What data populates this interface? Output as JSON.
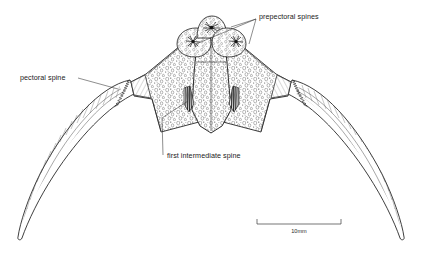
{
  "figure": {
    "type": "scientific-line-illustration",
    "background_color": "#ffffff",
    "ink_color": "#1c1c1c"
  },
  "labels": [
    {
      "id": "prepectoral-spines",
      "text": "prepectoral spines",
      "x": 259,
      "y": 17,
      "anchor": "start",
      "leader_origin": [
        256,
        19
      ],
      "leader_targets": [
        [
          196,
          44
        ],
        [
          231,
          27
        ],
        [
          249,
          44
        ]
      ]
    },
    {
      "id": "pectoral-spine",
      "text": "pectoral spine",
      "x": 20,
      "y": 80,
      "anchor": "start",
      "leader_origin": [
        78,
        78
      ],
      "leader_targets": [
        [
          118,
          89
        ]
      ]
    },
    {
      "id": "first-intermediate-spine",
      "text": "first intermediate spine",
      "x": 166,
      "y": 158,
      "anchor": "start",
      "leader_origin": [
        162,
        155
      ],
      "leader_targets": [
        [
          162,
          118
        ],
        [
          188,
          101
        ]
      ]
    }
  ],
  "scale_bar": {
    "label": "10mm",
    "x_start": 257,
    "x_end": 341,
    "y": 224,
    "tick_height": 5,
    "label_x": 299,
    "label_y": 234
  },
  "anatomy": {
    "central_plate": "stippled pentagonal coracoid shield",
    "lateral_plates": "paired stippled wing plates",
    "prepectoral_lobes": 3,
    "intermediate_spine_clusters": 2,
    "pectoral_spines": 2,
    "pectoral_spine_rays": 9
  }
}
